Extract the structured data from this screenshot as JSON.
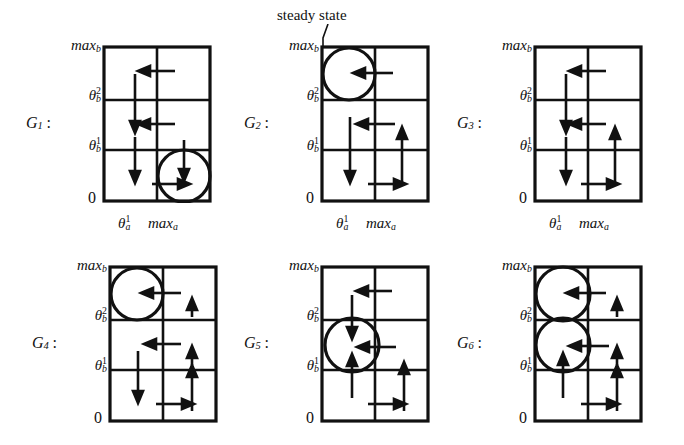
{
  "figure": {
    "kind": "phase-portrait-grid",
    "background": "#ffffff",
    "ink": "#111111",
    "annotation": {
      "text": "steady state",
      "name": "steady-state-callout",
      "points_to": "G2 top-left circle"
    },
    "axis": {
      "y_ticks": [
        "max",
        "θ",
        "θ",
        "0"
      ],
      "y_tick_labels": [
        "max_b",
        "theta_b^2",
        "theta_b^1",
        "0"
      ],
      "x_ticks": [
        "theta_a^1",
        "max_a"
      ],
      "y_top_label": "max",
      "y_top_sub": "b",
      "y_mid2_base": "θ",
      "y_mid2_sup": "2",
      "y_mid2_sub": "b",
      "y_mid1_base": "θ",
      "y_mid1_sup": "1",
      "y_mid1_sub": "b",
      "y_zero": "0",
      "x_theta_base": "θ",
      "x_theta_sup": "1",
      "x_theta_sub": "a",
      "x_max_base": "max",
      "x_max_sub": "a"
    },
    "panels": [
      {
        "id": "G1",
        "label_base": "G",
        "label_sub": "1",
        "label_colon": ":",
        "row": 0,
        "col": 0,
        "circles": [
          {
            "cell_col": 1,
            "cell_row": 2,
            "desc": "bottom-right cell"
          }
        ],
        "arrows": [
          {
            "dir": "left",
            "cell_col": 1,
            "cell_row": 0,
            "desc": "top-right cell pointing left"
          },
          {
            "dir": "down",
            "cell_col": 0,
            "cell_row": 0,
            "desc": "top-left cell pointing down"
          },
          {
            "dir": "down",
            "cell_col": 0,
            "cell_row": 1,
            "desc": "middle-left cell pointing down"
          },
          {
            "dir": "left",
            "cell_col": 1,
            "cell_row": 1,
            "desc": "middle-right cell pointing left"
          },
          {
            "dir": "down",
            "cell_col": 0,
            "cell_row": 2,
            "desc": "bottom-left cell pointing down"
          },
          {
            "dir": "down",
            "cell_col": 1,
            "cell_row": 2,
            "desc": "into circle from above"
          },
          {
            "dir": "right",
            "cell_col": 1,
            "cell_row": 2,
            "desc": "into circle from left"
          }
        ]
      },
      {
        "id": "G2",
        "label_base": "G",
        "label_sub": "2",
        "label_colon": ":",
        "row": 0,
        "col": 1,
        "circles": [
          {
            "cell_col": 0,
            "cell_row": 0,
            "desc": "top-left cell"
          }
        ],
        "arrows": [
          {
            "dir": "left",
            "cell_col": 0,
            "cell_row": 0,
            "desc": "into circle from right"
          },
          {
            "dir": "left",
            "cell_col": 1,
            "cell_row": 1,
            "desc": "middle-right pointing left"
          },
          {
            "dir": "down",
            "cell_col": 0,
            "cell_row": 1,
            "desc": "middle-left pointing down"
          },
          {
            "dir": "down",
            "cell_col": 0,
            "cell_row": 2,
            "desc": "bottom-left pointing down"
          },
          {
            "dir": "up",
            "cell_col": 1,
            "cell_row": 2,
            "desc": "bottom-right pointing up"
          },
          {
            "dir": "right",
            "cell_col": 0,
            "cell_row": 2,
            "desc": "bottom pointing right"
          }
        ]
      },
      {
        "id": "G3",
        "label_base": "G",
        "label_sub": "3",
        "label_colon": ":",
        "row": 0,
        "col": 2,
        "circles": [],
        "arrows": [
          {
            "dir": "left",
            "cell_col": 1,
            "cell_row": 0,
            "desc": "top-right pointing left"
          },
          {
            "dir": "down",
            "cell_col": 0,
            "cell_row": 0,
            "desc": "top-left pointing down"
          },
          {
            "dir": "down",
            "cell_col": 0,
            "cell_row": 1,
            "desc": "middle-left pointing down"
          },
          {
            "dir": "left",
            "cell_col": 1,
            "cell_row": 1,
            "desc": "middle-right pointing left"
          },
          {
            "dir": "down",
            "cell_col": 0,
            "cell_row": 2,
            "desc": "bottom-left pointing down"
          },
          {
            "dir": "up",
            "cell_col": 1,
            "cell_row": 2,
            "desc": "bottom-right pointing up"
          },
          {
            "dir": "right",
            "cell_col": 0,
            "cell_row": 2,
            "desc": "bottom pointing right"
          }
        ]
      },
      {
        "id": "G4",
        "label_base": "G",
        "label_sub": "4",
        "label_colon": ":",
        "row": 1,
        "col": 0,
        "circles": [
          {
            "cell_col": 0,
            "cell_row": 0,
            "desc": "top-left cell"
          }
        ],
        "arrows": [
          {
            "dir": "left",
            "cell_col": 0,
            "cell_row": 0,
            "desc": "into circle from right"
          },
          {
            "dir": "up",
            "cell_col": 1,
            "cell_row": 0,
            "desc": "top-right pointing up"
          },
          {
            "dir": "left",
            "cell_col": 1,
            "cell_row": 1,
            "desc": "middle pointing left"
          },
          {
            "dir": "up",
            "cell_col": 1,
            "cell_row": 1,
            "desc": "middle-right pointing up"
          },
          {
            "dir": "down",
            "cell_col": 0,
            "cell_row": 1,
            "desc": "middle-left pointing down"
          },
          {
            "dir": "down",
            "cell_col": 0,
            "cell_row": 2,
            "desc": "bottom-left pointing down"
          },
          {
            "dir": "up",
            "cell_col": 1,
            "cell_row": 2,
            "desc": "bottom-right pointing up"
          },
          {
            "dir": "right",
            "cell_col": 0,
            "cell_row": 2,
            "desc": "bottom pointing right"
          }
        ]
      },
      {
        "id": "G5",
        "label_base": "G",
        "label_sub": "5",
        "label_colon": ":",
        "row": 1,
        "col": 1,
        "circles": [
          {
            "cell_col": 0,
            "cell_row": 1,
            "desc": "middle-left cell"
          }
        ],
        "arrows": [
          {
            "dir": "left",
            "cell_col": 1,
            "cell_row": 0,
            "desc": "top-right pointing left"
          },
          {
            "dir": "down",
            "cell_col": 0,
            "cell_row": 0,
            "desc": "into circle from above"
          },
          {
            "dir": "left",
            "cell_col": 1,
            "cell_row": 1,
            "desc": "into circle from right"
          },
          {
            "dir": "up",
            "cell_col": 0,
            "cell_row": 2,
            "desc": "into circle from below"
          },
          {
            "dir": "up",
            "cell_col": 1,
            "cell_row": 2,
            "desc": "bottom-right pointing up"
          },
          {
            "dir": "right",
            "cell_col": 0,
            "cell_row": 2,
            "desc": "bottom pointing right"
          }
        ]
      },
      {
        "id": "G6",
        "label_base": "G",
        "label_sub": "6",
        "label_colon": ":",
        "row": 1,
        "col": 2,
        "circles": [
          {
            "cell_col": 0,
            "cell_row": 0,
            "desc": "top-left cell"
          },
          {
            "cell_col": 0,
            "cell_row": 1,
            "desc": "middle-left cell"
          }
        ],
        "arrows": [
          {
            "dir": "left",
            "cell_col": 0,
            "cell_row": 0,
            "desc": "into top circle from right"
          },
          {
            "dir": "up",
            "cell_col": 1,
            "cell_row": 0,
            "desc": "top-right pointing up"
          },
          {
            "dir": "left",
            "cell_col": 0,
            "cell_row": 1,
            "desc": "into middle circle from right"
          },
          {
            "dir": "up",
            "cell_col": 1,
            "cell_row": 1,
            "desc": "middle-right pointing up"
          },
          {
            "dir": "up",
            "cell_col": 0,
            "cell_row": 2,
            "desc": "into middle circle from below"
          },
          {
            "dir": "up",
            "cell_col": 1,
            "cell_row": 2,
            "desc": "bottom-right pointing up"
          },
          {
            "dir": "right",
            "cell_col": 0,
            "cell_row": 2,
            "desc": "bottom pointing right"
          }
        ]
      }
    ]
  }
}
